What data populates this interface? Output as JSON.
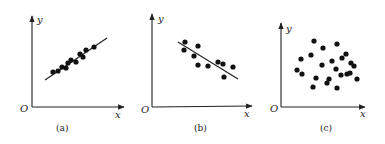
{
  "chart_data": [
    {
      "type": "scatter",
      "title": "",
      "caption": "(a)",
      "xlabel": "x",
      "ylabel": "y",
      "origin_label": "O",
      "trend": "strong positive linear correlation",
      "fit_line": {
        "x1": 45,
        "y1": 80,
        "x2": 107,
        "y2": 38
      },
      "points": [
        [
          53,
          72
        ],
        [
          58,
          71
        ],
        [
          62,
          67
        ],
        [
          66,
          68
        ],
        [
          68,
          63
        ],
        [
          71,
          60
        ],
        [
          76,
          62
        ],
        [
          80,
          54
        ],
        [
          83,
          57
        ],
        [
          86,
          50
        ],
        [
          94,
          47
        ]
      ]
    },
    {
      "type": "scatter",
      "title": "",
      "caption": "(b)",
      "xlabel": "x",
      "ylabel": "y",
      "origin_label": "O",
      "trend": "negative linear correlation",
      "fit_line": {
        "x1": 178,
        "y1": 42,
        "x2": 238,
        "y2": 79
      },
      "points": [
        [
          185,
          42
        ],
        [
          184,
          50
        ],
        [
          194,
          56
        ],
        [
          198,
          46
        ],
        [
          198,
          65
        ],
        [
          208,
          66
        ],
        [
          218,
          62
        ],
        [
          223,
          64
        ],
        [
          224,
          77
        ],
        [
          233,
          67
        ]
      ]
    },
    {
      "type": "scatter",
      "title": "",
      "caption": "(c)",
      "xlabel": "x",
      "ylabel": "y",
      "origin_label": "O",
      "trend": "no correlation",
      "points": [
        [
          314,
          41
        ],
        [
          337,
          44
        ],
        [
          323,
          48
        ],
        [
          301,
          59
        ],
        [
          311,
          55
        ],
        [
          322,
          65
        ],
        [
          332,
          61
        ],
        [
          342,
          58
        ],
        [
          346,
          54
        ],
        [
          351,
          63
        ],
        [
          297,
          70
        ],
        [
          302,
          74
        ],
        [
          316,
          78
        ],
        [
          329,
          79
        ],
        [
          336,
          69
        ],
        [
          341,
          75
        ],
        [
          350,
          73
        ],
        [
          357,
          79
        ],
        [
          313,
          87
        ],
        [
          327,
          83
        ],
        [
          337,
          88
        ],
        [
          347,
          74
        ],
        [
          354,
          66
        ]
      ]
    }
  ],
  "labels": {
    "a": {
      "x": "x",
      "y": "y",
      "o": "O",
      "cap": "(a)"
    },
    "b": {
      "x": "x",
      "y": "y",
      "o": "O",
      "cap": "(b)"
    },
    "c": {
      "x": "x",
      "y": "y",
      "o": "O",
      "cap": "(c)"
    }
  }
}
